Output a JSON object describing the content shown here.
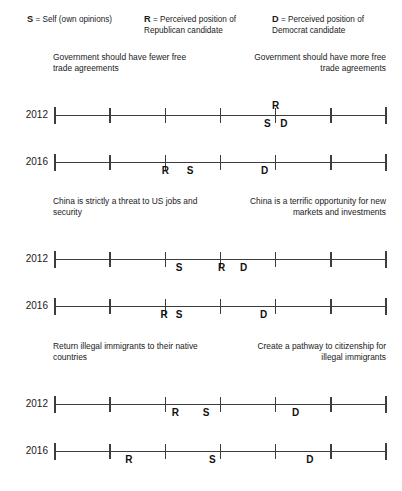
{
  "legend": {
    "items": [
      {
        "name": "legend-self",
        "key": "S",
        "text": " = Self (own opinions)"
      },
      {
        "name": "legend-republican",
        "key": "R",
        "text": " = Perceived position of Republican candidate"
      },
      {
        "name": "legend-democrat",
        "key": "D",
        "text": " = Perceived position of Democrat candidate"
      }
    ]
  },
  "chart_data": {
    "type": "scatter",
    "title": "",
    "xlabel": "",
    "ylabel": "",
    "xlim": [
      1,
      7
    ],
    "ticks": [
      1,
      2,
      3,
      4,
      5,
      6,
      7
    ],
    "grid": false,
    "legend_position": "top",
    "marker_labels": {
      "S": "Self (own opinions)",
      "R": "Perceived position of Republican candidate",
      "D": "Perceived position of Democrat candidate"
    },
    "panels": [
      {
        "id": "free-trade",
        "left_caption": "Government should have fewer free trade agreements",
        "right_caption": "Government should have more free trade agreements",
        "rows": [
          {
            "year": "2012",
            "points": [
              {
                "label": "S",
                "value": 4.85,
                "position": "below"
              },
              {
                "label": "R",
                "value": 5.0,
                "position": "above"
              },
              {
                "label": "D",
                "value": 5.15,
                "position": "below"
              }
            ]
          },
          {
            "year": "2016",
            "points": [
              {
                "label": "R",
                "value": 3.0,
                "position": "below"
              },
              {
                "label": "S",
                "value": 3.45,
                "position": "below"
              },
              {
                "label": "D",
                "value": 4.8,
                "position": "below"
              }
            ]
          }
        ]
      },
      {
        "id": "china",
        "left_caption": "China is strictly a threat to US jobs and security",
        "right_caption": "China is a terrific opportunity for new markets and investments",
        "rows": [
          {
            "year": "2012",
            "points": [
              {
                "label": "S",
                "value": 3.25,
                "position": "below"
              },
              {
                "label": "R",
                "value": 4.02,
                "position": "below"
              },
              {
                "label": "D",
                "value": 4.42,
                "position": "below"
              }
            ]
          },
          {
            "year": "2016",
            "points": [
              {
                "label": "R",
                "value": 2.98,
                "position": "below"
              },
              {
                "label": "S",
                "value": 3.25,
                "position": "below"
              },
              {
                "label": "D",
                "value": 4.78,
                "position": "below"
              }
            ]
          }
        ]
      },
      {
        "id": "immigration",
        "left_caption": "Return illegal immigrants to their native countries",
        "right_caption": "Create a pathway to citizenship for illegal immigrants",
        "rows": [
          {
            "year": "2012",
            "points": [
              {
                "label": "R",
                "value": 3.18,
                "position": "below"
              },
              {
                "label": "S",
                "value": 3.74,
                "position": "below"
              },
              {
                "label": "D",
                "value": 5.36,
                "position": "below"
              }
            ]
          },
          {
            "year": "2016",
            "points": [
              {
                "label": "R",
                "value": 2.34,
                "position": "below"
              },
              {
                "label": "S",
                "value": 3.85,
                "position": "below"
              },
              {
                "label": "D",
                "value": 5.62,
                "position": "below"
              }
            ]
          }
        ]
      }
    ]
  }
}
